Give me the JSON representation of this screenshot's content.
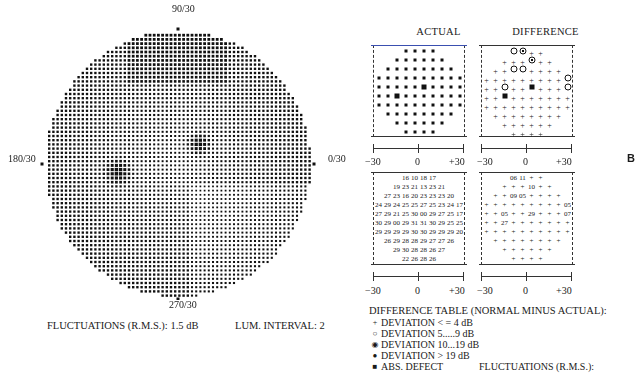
{
  "figure_label": "B",
  "visual_field": {
    "label_top": "90/30",
    "label_bottom": "270/30",
    "label_left": "180/30",
    "label_right": "0/30",
    "fluctuations": "FLUCTUATIONS (R.M.S.): 1.5 dB",
    "lum_interval": "LUM. INTERVAL: 2"
  },
  "panels": {
    "actual_title": "ACTUAL",
    "difference_title": "DIFFERENCE",
    "axis_ticks": [
      "−30",
      "0",
      "+30"
    ]
  },
  "legend": {
    "title": "DIFFERENCE TABLE (NORMAL MINUS ACTUAL):",
    "items": [
      {
        "symbol": "+",
        "label": "DEVIATION < = 4 dB"
      },
      {
        "symbol": "○",
        "label": "DEVIATION 5.....9 dB"
      },
      {
        "symbol": "◉",
        "label": "DEVIATION 10...19 dB"
      },
      {
        "symbol": "●",
        "label": "DEVIATION > 19 dB"
      },
      {
        "symbol": "■",
        "label": "ABS. DEFECT"
      }
    ],
    "fluctuations": "FLUCTUATIONS (R.M.S.):"
  },
  "chart_data": [
    {
      "type": "heatmap",
      "title": "Visual field grayscale (central 30°)",
      "axis_labels": {
        "top": "90/30",
        "bottom": "270/30",
        "left": "180/30",
        "right": "0/30"
      },
      "annotations": [
        "Two dark scotomas: blind spot region left of center-low, defect right of center-high"
      ],
      "fluctuations_rms_db": 1.5,
      "lum_interval": 2
    },
    {
      "type": "table",
      "title": "ACTUAL",
      "xlabel_ticks": [
        "-30",
        "0",
        "+30"
      ],
      "rows": [
        [
          "16",
          "10",
          "18",
          "17"
        ],
        [
          "19",
          "23",
          "21",
          "13",
          "23",
          "21"
        ],
        [
          "27",
          "23",
          "16",
          "20",
          "23",
          "23",
          "23",
          "20"
        ],
        [
          "24",
          "29",
          "24",
          "25",
          "25",
          "27",
          "25",
          "23",
          "24",
          "17"
        ],
        [
          "27",
          "29",
          "21",
          "25",
          "30",
          "00",
          "29",
          "27",
          "25",
          "17"
        ],
        [
          "30",
          "29",
          "00",
          "29",
          "31",
          "31",
          "30",
          "29",
          "25",
          "25"
        ],
        [
          "29",
          "29",
          "29",
          "29",
          "30",
          "30",
          "29",
          "29",
          "29",
          "20"
        ],
        [
          "26",
          "29",
          "28",
          "28",
          "29",
          "27",
          "27",
          "26"
        ],
        [
          "29",
          "30",
          "28",
          "28",
          "26",
          "27"
        ],
        [
          "22",
          "26",
          "28",
          "26"
        ]
      ]
    },
    {
      "type": "table",
      "title": "DIFFERENCE",
      "xlabel_ticks": [
        "-30",
        "0",
        "+30"
      ],
      "rows": [
        [
          "06",
          "11",
          "+",
          "+"
        ],
        [
          "+",
          "+",
          "+",
          "10",
          "+",
          "+"
        ],
        [
          "+",
          "+",
          "09",
          "05",
          "+",
          "+",
          "+",
          "+"
        ],
        [
          "+",
          "+",
          "+",
          "+",
          "+",
          "+",
          "+",
          "+",
          "+",
          "05"
        ],
        [
          "+",
          "+",
          "05",
          "+",
          "+",
          "29",
          "+",
          "+",
          "+",
          "07"
        ],
        [
          "+",
          "+",
          "27",
          "+",
          "+",
          "+",
          "+",
          "+",
          "+",
          "+"
        ],
        [
          "+",
          "+",
          "+",
          "+",
          "+",
          "+",
          "+",
          "+",
          "+",
          "+"
        ],
        [
          "+",
          "+",
          "+",
          "+",
          "+",
          "+",
          "+",
          "+"
        ],
        [
          "+",
          "+",
          "+",
          "+",
          "+",
          "+"
        ],
        [
          "+",
          "+",
          "+",
          "+"
        ]
      ]
    }
  ]
}
